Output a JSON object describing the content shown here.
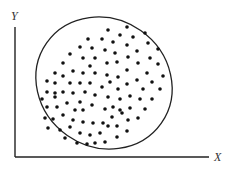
{
  "diagram": {
    "type": "scatter-ellipse",
    "colors": {
      "background": "#ffffff",
      "stroke": "#222222",
      "dot": "#111111",
      "label": "#333333"
    },
    "axes": {
      "x_label": "X",
      "y_label": "Y",
      "origin": [
        15,
        157
      ],
      "x_end": [
        209,
        157
      ],
      "y_end": [
        15,
        27
      ],
      "x_label_pos": [
        214,
        161
      ],
      "y_label_pos": [
        11,
        20
      ]
    },
    "ellipse": {
      "cx": 104,
      "cy": 83,
      "rx": 70,
      "ry": 64,
      "rotation": 35
    },
    "dot_radius": 1.8,
    "points": [
      [
        127,
        27
      ],
      [
        108,
        30
      ],
      [
        145,
        33
      ],
      [
        120,
        35
      ],
      [
        133,
        37
      ],
      [
        88,
        39
      ],
      [
        102,
        39
      ],
      [
        113,
        42
      ],
      [
        148,
        43
      ],
      [
        127,
        45
      ],
      [
        80,
        47
      ],
      [
        92,
        48
      ],
      [
        105,
        50
      ],
      [
        137,
        51
      ],
      [
        158,
        49
      ],
      [
        70,
        54
      ],
      [
        115,
        53
      ],
      [
        83,
        58
      ],
      [
        95,
        58
      ],
      [
        128,
        57
      ],
      [
        150,
        58
      ],
      [
        63,
        63
      ],
      [
        107,
        63
      ],
      [
        117,
        62
      ],
      [
        138,
        63
      ],
      [
        158,
        64
      ],
      [
        90,
        66
      ],
      [
        73,
        71
      ],
      [
        55,
        73
      ],
      [
        83,
        73
      ],
      [
        95,
        73
      ],
      [
        107,
        75
      ],
      [
        118,
        77
      ],
      [
        127,
        70
      ],
      [
        147,
        73
      ],
      [
        163,
        76
      ],
      [
        63,
        76
      ],
      [
        47,
        81
      ],
      [
        55,
        83
      ],
      [
        70,
        83
      ],
      [
        80,
        83
      ],
      [
        90,
        83
      ],
      [
        110,
        82
      ],
      [
        127,
        84
      ],
      [
        137,
        80
      ],
      [
        152,
        82
      ],
      [
        102,
        87
      ],
      [
        118,
        89
      ],
      [
        143,
        89
      ],
      [
        160,
        89
      ],
      [
        47,
        92
      ],
      [
        55,
        93
      ],
      [
        63,
        92
      ],
      [
        73,
        93
      ],
      [
        85,
        92
      ],
      [
        95,
        95
      ],
      [
        108,
        97
      ],
      [
        130,
        96
      ],
      [
        120,
        99
      ],
      [
        140,
        99
      ],
      [
        152,
        99
      ],
      [
        42,
        99
      ],
      [
        55,
        97
      ],
      [
        67,
        103
      ],
      [
        80,
        102
      ],
      [
        92,
        105
      ],
      [
        47,
        107
      ],
      [
        57,
        107
      ],
      [
        75,
        110
      ],
      [
        83,
        110
      ],
      [
        105,
        109
      ],
      [
        113,
        107
      ],
      [
        120,
        110
      ],
      [
        130,
        108
      ],
      [
        145,
        109
      ],
      [
        45,
        118
      ],
      [
        53,
        119
      ],
      [
        63,
        115
      ],
      [
        73,
        120
      ],
      [
        83,
        122
      ],
      [
        93,
        123
      ],
      [
        103,
        123
      ],
      [
        112,
        117
      ],
      [
        122,
        113
      ],
      [
        128,
        120
      ],
      [
        138,
        118
      ],
      [
        48,
        128
      ],
      [
        60,
        130
      ],
      [
        70,
        127
      ],
      [
        80,
        133
      ],
      [
        90,
        135
      ],
      [
        100,
        133
      ],
      [
        108,
        126
      ],
      [
        117,
        126
      ],
      [
        127,
        131
      ],
      [
        65,
        138
      ],
      [
        77,
        143
      ],
      [
        87,
        144
      ],
      [
        95,
        143
      ],
      [
        105,
        142
      ],
      [
        117,
        137
      ]
    ]
  }
}
